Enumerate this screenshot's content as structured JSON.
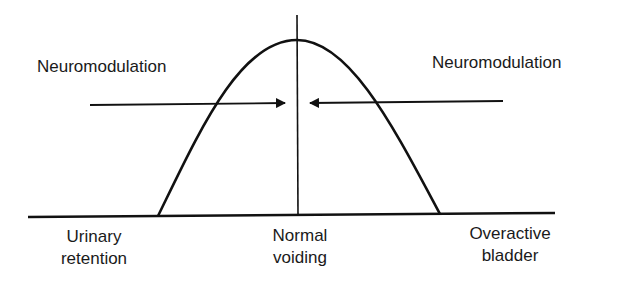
{
  "diagram": {
    "type": "bell-curve",
    "labels": {
      "neuromodulation_left": "Neuromodulation",
      "neuromodulation_right": "Neuromodulation",
      "urinary_retention_line1": "Urinary",
      "urinary_retention_line2": "retention",
      "normal_voiding_line1": "Normal",
      "normal_voiding_line2": "voiding",
      "overactive_bladder_line1": "Overactive",
      "overactive_bladder_line2": "bladder"
    },
    "colors": {
      "stroke": "#111111",
      "background": "#ffffff"
    }
  }
}
